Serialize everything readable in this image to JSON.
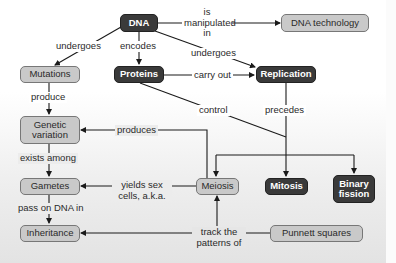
{
  "concept_map": {
    "nodes": {
      "dna": {
        "label": "DNA",
        "style": "dark"
      },
      "dna_technology": {
        "label": "DNA technology",
        "style": "light"
      },
      "mutations": {
        "label": "Mutations",
        "style": "light"
      },
      "proteins": {
        "label": "Proteins",
        "style": "dark"
      },
      "replication": {
        "label": "Replication",
        "style": "dark"
      },
      "genetic_variation": {
        "label": "Genetic variation",
        "style": "light"
      },
      "gametes": {
        "label": "Gametes",
        "style": "light"
      },
      "inheritance": {
        "label": "Inheritance",
        "style": "light"
      },
      "meiosis": {
        "label": "Meiosis",
        "style": "light"
      },
      "mitosis": {
        "label": "Mitosis",
        "style": "dark"
      },
      "binary_fission": {
        "label": "Binary fission",
        "style": "dark"
      },
      "punnett_squares": {
        "label": "Punnett squares",
        "style": "light"
      }
    },
    "links": {
      "dna_tech": "is manipulated in",
      "dna_mutations": "undergoes",
      "dna_proteins": "encodes",
      "dna_replication": "undergoes",
      "proteins_replication": "carry out",
      "proteins_control": "control",
      "mutations_variation": "produce",
      "replication_precedes": "precedes",
      "meiosis_variation": "produces",
      "variation_gametes": "exists among",
      "meiosis_gametes": "yields sex cells, a.k.a.",
      "gametes_inheritance": "pass on DNA in",
      "punnett_track": "track the patterns of"
    }
  }
}
